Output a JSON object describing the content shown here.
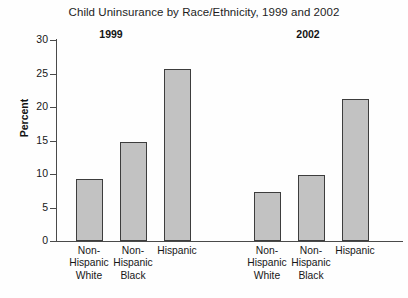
{
  "chart_data": {
    "type": "bar",
    "title": "Child Uninsurance by Race/Ethnicity, 1999 and 2002",
    "xlabel": "",
    "ylabel": "Percent",
    "ylim": [
      0,
      30
    ],
    "yticks": [
      0,
      5,
      10,
      15,
      20,
      25,
      30
    ],
    "grid": false,
    "legend": "none",
    "groups": [
      {
        "name": "1999",
        "categories": [
          "Non-Hispanic White",
          "Non-Hispanic Black",
          "Hispanic"
        ],
        "values": [
          9.2,
          14.8,
          25.7
        ]
      },
      {
        "name": "2002",
        "categories": [
          "Non-Hispanic White",
          "Non-Hispanic Black",
          "Hispanic"
        ],
        "values": [
          7.3,
          9.9,
          21.2
        ]
      }
    ],
    "bars": [
      {
        "group": "1999",
        "category": "Non-Hispanic White",
        "value": 9.2,
        "label_lines": [
          "Non-",
          "Hispanic",
          "White"
        ]
      },
      {
        "group": "1999",
        "category": "Non-Hispanic Black",
        "value": 14.8,
        "label_lines": [
          "Non-",
          "Hispanic",
          "Black"
        ]
      },
      {
        "group": "1999",
        "category": "Hispanic",
        "value": 25.7,
        "label_lines": [
          "Hispanic"
        ]
      },
      {
        "group": "2002",
        "category": "Non-Hispanic White",
        "value": 7.3,
        "label_lines": [
          "Non-",
          "Hispanic",
          "White"
        ]
      },
      {
        "group": "2002",
        "category": "Non-Hispanic Black",
        "value": 9.9,
        "label_lines": [
          "Non-",
          "Hispanic",
          "Black"
        ]
      },
      {
        "group": "2002",
        "category": "Hispanic",
        "value": 21.2,
        "label_lines": [
          "Hispanic"
        ]
      }
    ],
    "colors": {
      "bar_fill": "#c2c2c2",
      "bar_edge": "#3d3d3d",
      "axis": "#4a4a4a",
      "text": "#171717",
      "background": "#fefefe"
    }
  }
}
